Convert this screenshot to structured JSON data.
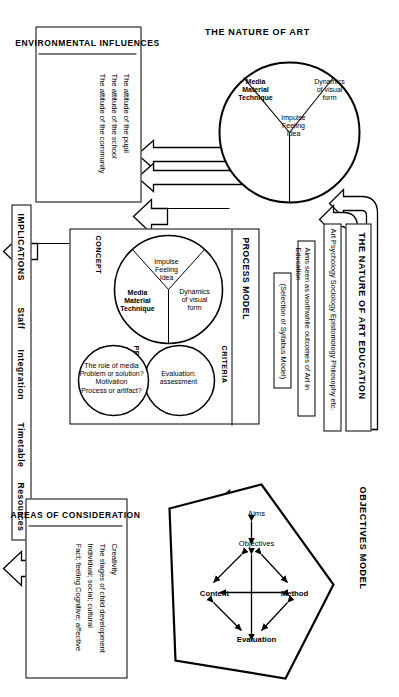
{
  "diagram": {
    "orientation": "rotated-90-ccw",
    "stroke_color": "#000000",
    "background_color": "#ffffff"
  },
  "nature_of_art": {
    "heading": "THE NATURE OF ART",
    "circle_segments": [
      {
        "id": "impulse",
        "label": "Impulse\nFeeling\nIdea"
      },
      {
        "id": "dynamics",
        "label": "Dynamics\nof visual\nform"
      },
      {
        "id": "media",
        "label": "Media\nMaterial\nTechnique"
      }
    ]
  },
  "nature_of_art_education": {
    "heading": "THE NATURE OF ART EDUCATION",
    "subheading": "Art Psychology Sociology Epistomology Philosophy etc.",
    "aims_box": "Aims seen as worthwhile outcomes of  Art in Education",
    "syllabus_box": "(Selection of Syllabus Model)"
  },
  "environmental_influences": {
    "heading": "ENVIRONMENTAL INFLUENCES",
    "items": [
      "The attitude of the pupil",
      "The attitude of the school",
      "The attitude of the community"
    ]
  },
  "process_model": {
    "heading": "PROCESS MODEL",
    "concept_label": "CONCEPT",
    "procedure_label": "PROCEDURE",
    "criteria_label": "CRITERIA",
    "concept_segments": [
      {
        "id": "impulse",
        "label": "Impulse\nFeeling\nIdea"
      },
      {
        "id": "dynamics",
        "label": "Dynamics\nof visual\nform"
      },
      {
        "id": "media",
        "label": "Media\nMaterial\nTechnique"
      }
    ],
    "procedure_circle": "The role of media\nProblem or solution?\nMotivation\nProcess or artifact?",
    "criteria_circle": "Evaluation:\nassessment"
  },
  "objectives_model": {
    "heading": "OBJECTIVES MODEL",
    "nodes": [
      {
        "id": "aims",
        "label": "Aims"
      },
      {
        "id": "objectives",
        "label": "Objectives"
      },
      {
        "id": "method",
        "label": "Method"
      },
      {
        "id": "content",
        "label": "Content"
      },
      {
        "id": "evaluation",
        "label": "Evaluation"
      }
    ]
  },
  "areas_of_consideration": {
    "heading": "AREAS OF CONSIDERATION",
    "items": [
      "Creativity",
      "The stages of  child development",
      "Individual; social; cultural",
      "Fact; feeling   Cognitive; affective"
    ]
  },
  "implications": {
    "heading": "IMPLICATIONS",
    "items": [
      "Staff",
      "Integration",
      "Timetable",
      "Resources"
    ]
  }
}
